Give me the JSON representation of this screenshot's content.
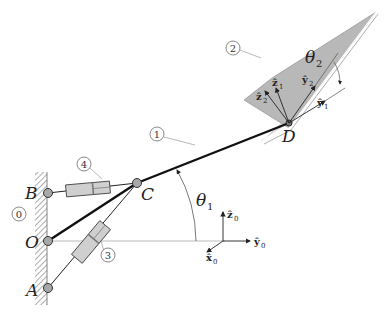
{
  "figure": {
    "points": {
      "B": "B",
      "O": "O",
      "A": "A",
      "C": "C",
      "D": "D"
    },
    "body_numbers": {
      "ground": "0",
      "link1": "1",
      "plate2": "2",
      "actuator3": "3",
      "actuator4": "4"
    },
    "angles": {
      "theta1": "θ",
      "theta1_sub": "1",
      "theta2": "θ",
      "theta2_sub": "2"
    },
    "frame0": {
      "z": "ẑ",
      "z_sub": "0",
      "y": "ŷ",
      "y_sub": "0",
      "x": "x̂",
      "x_sub": "0"
    },
    "frame1": {
      "z": "ẑ",
      "z_sub": "1",
      "y": "ŷ",
      "y_sub": "1"
    },
    "frame2": {
      "z": "ẑ",
      "z_sub": "2",
      "y": "ŷ",
      "y_sub": "2"
    },
    "colors": {
      "plate_fill": "#b5b5b5",
      "actuator_fill": "#cfcfcf",
      "joint_fill": "#a8a8a8",
      "link": "#111111",
      "thin_line": "#555555"
    }
  }
}
